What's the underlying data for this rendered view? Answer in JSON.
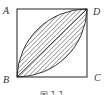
{
  "figure": {
    "type": "geometry",
    "vertices": {
      "A": "A",
      "B": "B",
      "C": "C",
      "D": "D"
    },
    "caption": "图 1-1",
    "colors": {
      "stroke": "#222222",
      "hatch": "#444444",
      "label": "#333333"
    }
  }
}
